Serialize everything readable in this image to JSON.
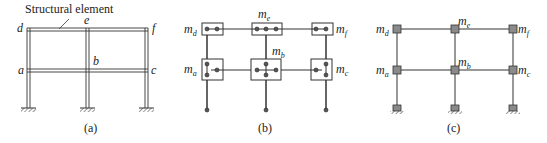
{
  "panels": [
    {
      "id": "a",
      "caption": "(a)",
      "annotation": "Structural element",
      "node_labels": {
        "d": "d",
        "e": "e",
        "f": "f",
        "a": "a",
        "b": "b",
        "c": "c"
      }
    },
    {
      "id": "b",
      "caption": "(b)",
      "mass_labels": {
        "d": {
          "base": "m",
          "sub": "d"
        },
        "e": {
          "base": "m",
          "sub": "e"
        },
        "f": {
          "base": "m",
          "sub": "f"
        },
        "a": {
          "base": "m",
          "sub": "a"
        },
        "b": {
          "base": "m",
          "sub": "b"
        },
        "c": {
          "base": "m",
          "sub": "c"
        }
      }
    },
    {
      "id": "c",
      "caption": "(c)",
      "mass_labels": {
        "d": {
          "base": "m",
          "sub": "d"
        },
        "e": {
          "base": "m",
          "sub": "e"
        },
        "f": {
          "base": "m",
          "sub": "f"
        },
        "a": {
          "base": "m",
          "sub": "a"
        },
        "b": {
          "base": "m",
          "sub": "b"
        },
        "c": {
          "base": "m",
          "sub": "c"
        }
      }
    }
  ],
  "colors": {
    "line": "#333333",
    "node_fill": "#8a8a8a",
    "background": "#ffffff"
  }
}
